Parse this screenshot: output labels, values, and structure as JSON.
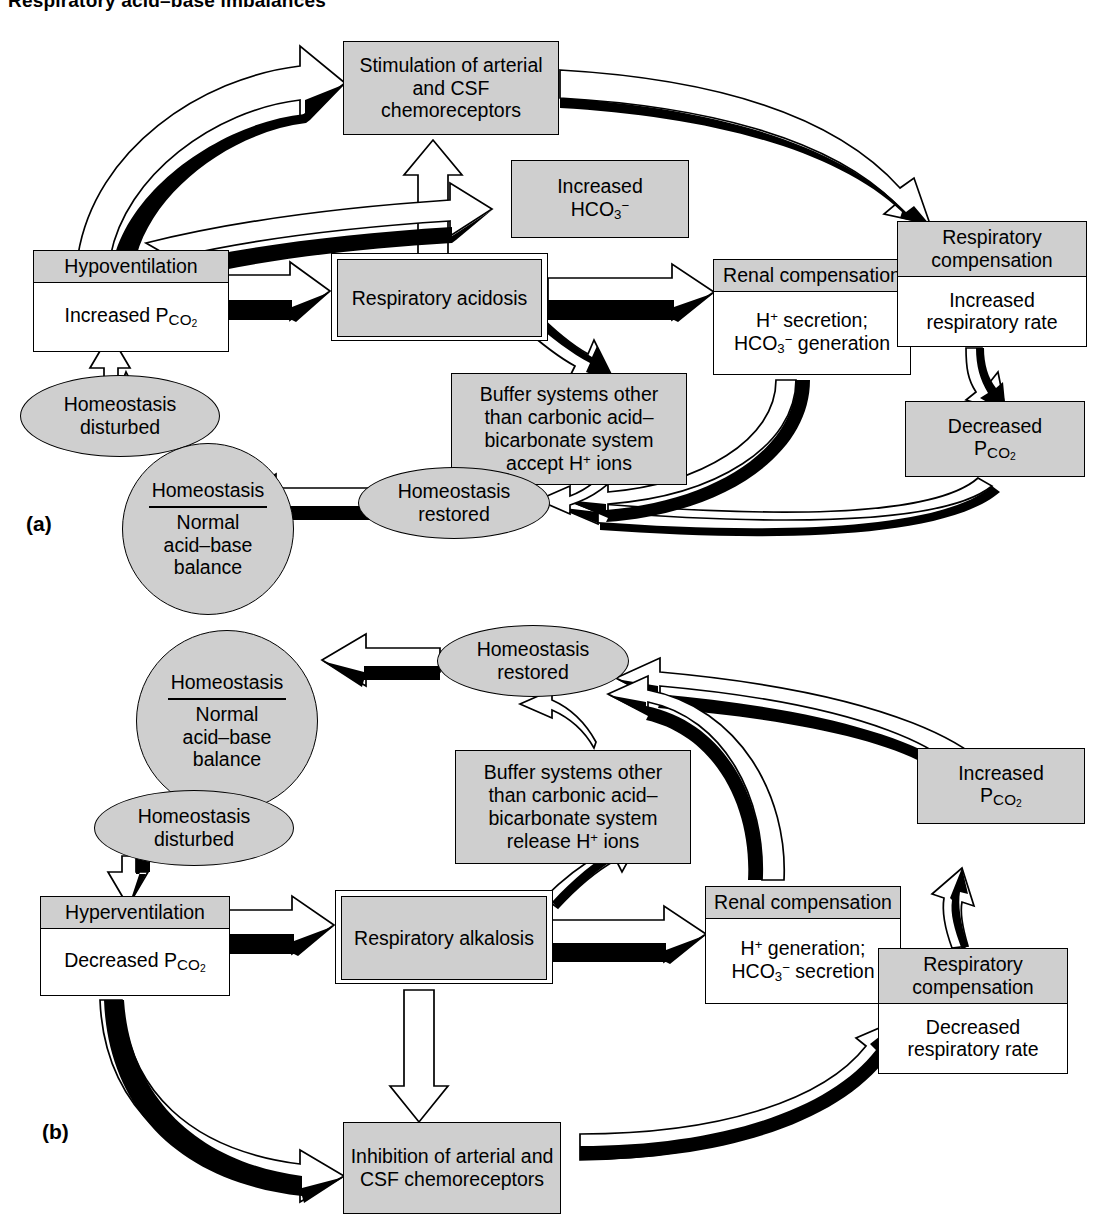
{
  "figure": {
    "title": "Respiratory acid–base imbalances",
    "panel_a_label": "(a)",
    "panel_b_label": "(b)"
  },
  "colors": {
    "fill_gray": "#cfcfcf",
    "stroke": "#000000",
    "page": "#ffffff"
  },
  "panel_a": {
    "chemoreceptors": "Stimulation of arterial and CSF chemoreceptors",
    "bicarbonate_line1": "Increased",
    "bicarbonate_line2_formula": "HCO3-",
    "ventilation_head": "Hypoventilation",
    "ventilation_body": "Increased PCO2",
    "imbalance": "Respiratory acidosis",
    "renal_head": "Renal compensation",
    "renal_body_line1": "H+ secretion;",
    "renal_body_line2": "HCO3- generation",
    "resp_comp_head": "Respiratory compensation",
    "resp_comp_body": "Increased respiratory rate",
    "pco2_result_line1": "Decreased",
    "pco2_result_line2": "PCO2",
    "buffer_line1": "Buffer systems other",
    "buffer_line2": "than carbonic acid–",
    "buffer_line3": "bicarbonate system",
    "buffer_line4": "accept H+ ions",
    "homeostasis_disturbed": "Homeostasis disturbed",
    "homeostasis_restored": "Homeostasis restored",
    "homeostasis_circle_top": "Homeostasis",
    "homeostasis_circle_line1": "Normal",
    "homeostasis_circle_line2": "acid–base",
    "homeostasis_circle_line3": "balance"
  },
  "panel_b": {
    "homeostasis_circle_top": "Homeostasis",
    "homeostasis_circle_line1": "Normal",
    "homeostasis_circle_line2": "acid–base",
    "homeostasis_circle_line3": "balance",
    "homeostasis_restored": "Homeostasis restored",
    "homeostasis_disturbed": "Homeostasis disturbed",
    "buffer_line1": "Buffer systems other",
    "buffer_line2": "than carbonic acid–",
    "buffer_line3": "bicarbonate system",
    "buffer_line4": "release H+ ions",
    "pco2_result_line1": "Increased",
    "pco2_result_line2": "PCO2",
    "ventilation_head": "Hyperventilation",
    "ventilation_body": "Decreased PCO2",
    "imbalance": "Respiratory alkalosis",
    "renal_head": "Renal compensation",
    "renal_body_line1": "H+ generation;",
    "renal_body_line2": "HCO3- secretion",
    "resp_comp_head": "Respiratory compensation",
    "resp_comp_body": "Decreased respiratory rate",
    "chemoreceptors": "Inhibition of arterial and CSF chemoreceptors"
  },
  "diagram_data": {
    "type": "flowchart",
    "panels": [
      {
        "label": "(a)",
        "topic": "Respiratory acidosis and its compensation",
        "nodes": [
          "Homeostasis / Normal acid–base balance",
          "Homeostasis disturbed",
          "Hypoventilation / Increased PCO2",
          "Respiratory acidosis",
          "Stimulation of arterial and CSF chemoreceptors",
          "Increased HCO3-",
          "Buffer systems other than carbonic acid–bicarbonate system accept H+ ions",
          "Renal compensation / H+ secretion; HCO3- generation",
          "Respiratory compensation / Increased respiratory rate",
          "Decreased PCO2",
          "Homeostasis restored"
        ],
        "edges": [
          "Homeostasis disturbed -> Hypoventilation / Increased PCO2",
          "Hypoventilation / Increased PCO2 -> Respiratory acidosis",
          "Hypoventilation / Increased PCO2 -> Stimulation of arterial and CSF chemoreceptors",
          "Respiratory acidosis -> Stimulation of arterial and CSF chemoreceptors",
          "Respiratory acidosis -> Increased HCO3-",
          "Respiratory acidosis -> Buffer systems other than carbonic acid–bicarbonate system accept H+ ions",
          "Respiratory acidosis -> Renal compensation / H+ secretion; HCO3- generation",
          "Stimulation of arterial and CSF chemoreceptors -> Respiratory compensation / Increased respiratory rate",
          "Respiratory compensation / Increased respiratory rate -> Decreased PCO2",
          "Decreased PCO2 -> Homeostasis restored",
          "Renal compensation / H+ secretion; HCO3- generation -> Homeostasis restored",
          "Buffer systems other than carbonic acid–bicarbonate system accept H+ ions -> Homeostasis restored",
          "Homeostasis restored -> Homeostasis / Normal acid–base balance"
        ]
      },
      {
        "label": "(b)",
        "topic": "Respiratory alkalosis and its compensation",
        "nodes": [
          "Homeostasis / Normal acid–base balance",
          "Homeostasis disturbed",
          "Hyperventilation / Decreased PCO2",
          "Respiratory alkalosis",
          "Buffer systems other than carbonic acid–bicarbonate system release H+ ions",
          "Renal compensation / H+ generation; HCO3- secretion",
          "Inhibition of arterial and CSF chemoreceptors",
          "Respiratory compensation / Decreased respiratory rate",
          "Increased PCO2",
          "Homeostasis restored"
        ],
        "edges": [
          "Homeostasis disturbed -> Hyperventilation / Decreased PCO2",
          "Hyperventilation / Decreased PCO2 -> Respiratory alkalosis",
          "Hyperventilation / Decreased PCO2 -> Inhibition of arterial and CSF chemoreceptors",
          "Respiratory alkalosis -> Buffer systems other than carbonic acid–bicarbonate system release H+ ions",
          "Respiratory alkalosis -> Renal compensation / H+ generation; HCO3- secretion",
          "Respiratory alkalosis -> Inhibition of arterial and CSF chemoreceptors",
          "Inhibition of arterial and CSF chemoreceptors -> Respiratory compensation / Decreased respiratory rate",
          "Respiratory compensation / Decreased respiratory rate -> Increased PCO2",
          "Increased PCO2 -> Homeostasis restored",
          "Renal compensation / H+ generation; HCO3- secretion -> Homeostasis restored",
          "Buffer systems other than carbonic acid–bicarbonate system release H+ ions -> Homeostasis restored",
          "Homeostasis restored -> Homeostasis / Normal acid–base balance"
        ]
      }
    ]
  }
}
